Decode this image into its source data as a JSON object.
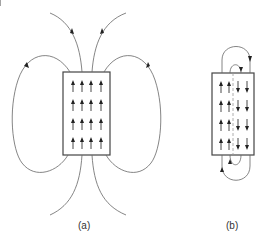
{
  "figure": {
    "panels": [
      {
        "id": "a",
        "label": "(a)",
        "description": "Single magnetic domain with external field lines looping outside"
      },
      {
        "id": "b",
        "label": "(b)",
        "description": "Two domains with opposite magnetization; flux closes near the sample"
      }
    ],
    "colors": {
      "line": "#555555",
      "arrow": "#222222",
      "background": "#ffffff",
      "domain_wall": "#999999"
    }
  }
}
